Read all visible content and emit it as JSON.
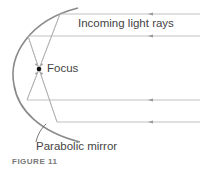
{
  "figure": {
    "caption": "FIGURE 11",
    "labels": {
      "incoming_rays": "Incoming light rays",
      "focus": "Focus",
      "mirror": "Parabolic mirror"
    },
    "colors": {
      "mirror": "#888888",
      "rays": "#b0b0b0",
      "focus": "#111111",
      "text": "#444444"
    },
    "rays_count": 4
  }
}
